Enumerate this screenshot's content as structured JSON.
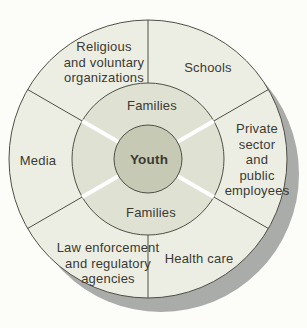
{
  "diagram": {
    "type": "concentric-rings",
    "center": {
      "label": "Youth"
    },
    "middle_ring": {
      "top_label": "Families",
      "bottom_label": "Families"
    },
    "outer_ring": {
      "segments": [
        {
          "id": "religious",
          "label": "Religious\nand voluntary\norganizations"
        },
        {
          "id": "schools",
          "label": "Schools"
        },
        {
          "id": "private-sector",
          "label": "Private\nsector\nand\npublic\nemployees"
        },
        {
          "id": "health-care",
          "label": "Health care"
        },
        {
          "id": "law-enforcement",
          "label": "Law enforcement\nand regulatory\nagencies"
        },
        {
          "id": "media",
          "label": "Media"
        }
      ]
    },
    "colors": {
      "background": "#fcfcf9",
      "shadow": "#a9aca9",
      "outer_ring": "#edeee3",
      "middle_ring": "#dfe1d3",
      "center": "#c6cab4",
      "stroke": "#4f4f47",
      "divider_white": "#ffffff",
      "text": "#3a3a33"
    }
  }
}
